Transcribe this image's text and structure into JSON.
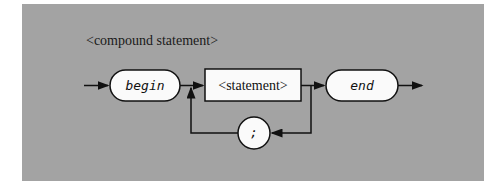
{
  "diagram": {
    "title": "<compound statement>",
    "type": "syntax-diagram",
    "nodes": [
      {
        "id": "begin",
        "kind": "terminal",
        "label": "begin"
      },
      {
        "id": "statement",
        "kind": "nonterminal",
        "label": "<statement>"
      },
      {
        "id": "end",
        "kind": "terminal",
        "label": "end"
      },
      {
        "id": "semicolon",
        "kind": "terminal",
        "label": ";"
      }
    ],
    "edges": [
      {
        "from": "entry",
        "to": "begin"
      },
      {
        "from": "begin",
        "to": "statement"
      },
      {
        "from": "statement",
        "to": "end"
      },
      {
        "from": "end",
        "to": "exit"
      },
      {
        "from": "statement",
        "to": "semicolon",
        "note": "loop back"
      },
      {
        "from": "semicolon",
        "to": "statement"
      }
    ]
  }
}
